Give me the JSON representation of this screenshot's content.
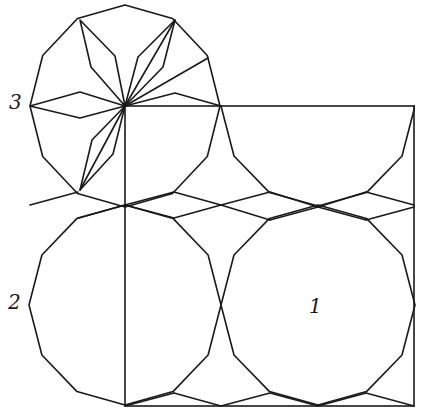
{
  "figure": {
    "type": "dodecagon-tiling-construction",
    "stroke_color": "#1a1a1a",
    "background": "#ffffff",
    "square": {
      "x1": 125,
      "y1": 106,
      "x2": 414,
      "y2": 406
    },
    "dodecagons": [
      {
        "id": "1",
        "cx": 318,
        "cy": 305,
        "r": 97,
        "ry": 100,
        "clip_to_square": false
      },
      {
        "id": "2",
        "cx": 125,
        "cy": 305,
        "r": 96,
        "ry": 100,
        "clip_to_square": false
      },
      {
        "id": "3",
        "cx": 125,
        "cy": 106,
        "r": 95,
        "ry": 101,
        "clip_to_square": false
      },
      {
        "id": "partial",
        "cx": 318,
        "cy": 106,
        "r": 97,
        "ry": 100,
        "clip_to_square": true
      }
    ],
    "tiling_segments": [
      [
        [
          125,
          205
        ],
        [
          174,
          192
        ]
      ],
      [
        [
          174,
          192
        ],
        [
          221,
          205
        ]
      ],
      [
        [
          221,
          205
        ],
        [
          270,
          192
        ]
      ],
      [
        [
          270,
          192
        ],
        [
          318,
          207
        ]
      ],
      [
        [
          318,
          207
        ],
        [
          366,
          192
        ]
      ],
      [
        [
          366,
          192
        ],
        [
          414,
          205
        ]
      ],
      [
        [
          125,
          205
        ],
        [
          174,
          218
        ]
      ],
      [
        [
          174,
          218
        ],
        [
          221,
          205
        ]
      ],
      [
        [
          221,
          205
        ],
        [
          270,
          220
        ]
      ],
      [
        [
          270,
          220
        ],
        [
          318,
          207
        ]
      ],
      [
        [
          318,
          207
        ],
        [
          366,
          220
        ]
      ],
      [
        [
          366,
          220
        ],
        [
          414,
          207
        ]
      ],
      [
        [
          125,
          406
        ],
        [
          174,
          393
        ]
      ],
      [
        [
          174,
          393
        ],
        [
          221,
          406
        ]
      ],
      [
        [
          221,
          406
        ],
        [
          270,
          393
        ]
      ],
      [
        [
          270,
          393
        ],
        [
          318,
          406
        ]
      ],
      [
        [
          318,
          406
        ],
        [
          366,
          393
        ]
      ],
      [
        [
          366,
          393
        ],
        [
          414,
          406
        ]
      ],
      [
        [
          78,
          218
        ],
        [
          125,
          205
        ]
      ],
      [
        [
          30,
          205
        ],
        [
          78,
          192
        ]
      ]
    ],
    "star_lines": [
      {
        "kind": "rhombus",
        "points": [
          [
            125,
            106
          ],
          [
            80,
            92
          ],
          [
            30,
            106
          ],
          [
            80,
            118
          ],
          [
            125,
            106
          ]
        ]
      },
      {
        "kind": "rhombus",
        "points": [
          [
            125,
            106
          ],
          [
            91,
            67
          ],
          [
            80,
            20
          ],
          [
            115,
            56
          ],
          [
            125,
            106
          ]
        ]
      },
      {
        "kind": "rhombus",
        "points": [
          [
            125,
            106
          ],
          [
            138,
            57
          ],
          [
            175,
            20
          ],
          [
            163,
            67
          ],
          [
            125,
            106
          ]
        ]
      },
      {
        "kind": "line",
        "points": [
          [
            125,
            106
          ],
          [
            175,
            20
          ]
        ]
      },
      {
        "kind": "line",
        "points": [
          [
            125,
            106
          ],
          [
            208,
            58
          ]
        ]
      },
      {
        "kind": "rhombus-half",
        "points": [
          [
            125,
            106
          ],
          [
            175,
            93
          ],
          [
            221,
            106
          ]
        ]
      },
      {
        "kind": "rhombus",
        "points": [
          [
            125,
            106
          ],
          [
            92,
            140
          ],
          [
            80,
            190
          ],
          [
            113,
            154
          ],
          [
            125,
            106
          ]
        ]
      },
      {
        "kind": "line",
        "points": [
          [
            125,
            106
          ],
          [
            80,
            190
          ]
        ]
      }
    ],
    "labels": [
      {
        "text": "1",
        "x": 309,
        "y": 296
      },
      {
        "text": "2",
        "x": 8,
        "y": 292
      },
      {
        "text": "3",
        "x": 9,
        "y": 92
      }
    ]
  }
}
